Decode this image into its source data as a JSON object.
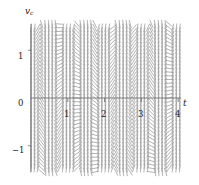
{
  "figure": {
    "background": "#ffffff",
    "line_color": "#9a9a9a",
    "axis_color": "#6b6b6b"
  },
  "axes": {
    "y_label": "v",
    "y_label_subscript": "c",
    "x_label": "t",
    "x_ticks": [
      {
        "value": 1,
        "label": "1"
      },
      {
        "value": 2,
        "label": "2"
      },
      {
        "value": 3,
        "label": "3"
      },
      {
        "value": 4,
        "label": "4"
      }
    ],
    "y_ticks": [
      {
        "value": 1,
        "label": "1"
      },
      {
        "value": 0,
        "label": "0"
      },
      {
        "value": -1,
        "label": "−1"
      }
    ]
  },
  "chart_data": {
    "type": "scatter",
    "subtype": "slope-field",
    "title": "",
    "xlabel": "t",
    "ylabel": "v_c",
    "xlim": [
      0,
      4.05
    ],
    "ylim": [
      -1.55,
      1.55
    ],
    "grid": false,
    "legend": null,
    "axis_position": {
      "x_axis_at_y": 0,
      "y_axis_at_x": 0
    },
    "slope_model": "dv/dt = 2*pi*cos(2*pi*t) - 0.55*v",
    "grid_spacing": {
      "dt": 0.0963,
      "dv": 0.0775
    },
    "segment_length_px": 7.6,
    "sample_slopes": [
      {
        "t": 0.0,
        "v": 0.0,
        "slope": 6.28
      },
      {
        "t": 0.25,
        "v": 0.0,
        "slope": 0.0
      },
      {
        "t": 0.5,
        "v": 0.0,
        "slope": -6.28
      },
      {
        "t": 0.75,
        "v": 0.0,
        "slope": 0.0
      },
      {
        "t": 1.0,
        "v": 1.0,
        "slope": 5.73
      },
      {
        "t": 1.5,
        "v": -1.0,
        "slope": -5.73
      },
      {
        "t": 2.0,
        "v": 0.5,
        "slope": 6.01
      },
      {
        "t": 2.5,
        "v": 0.5,
        "slope": -6.56
      },
      {
        "t": 3.0,
        "v": -0.5,
        "slope": 6.56
      },
      {
        "t": 3.5,
        "v": 1.0,
        "slope": -6.83
      }
    ]
  }
}
